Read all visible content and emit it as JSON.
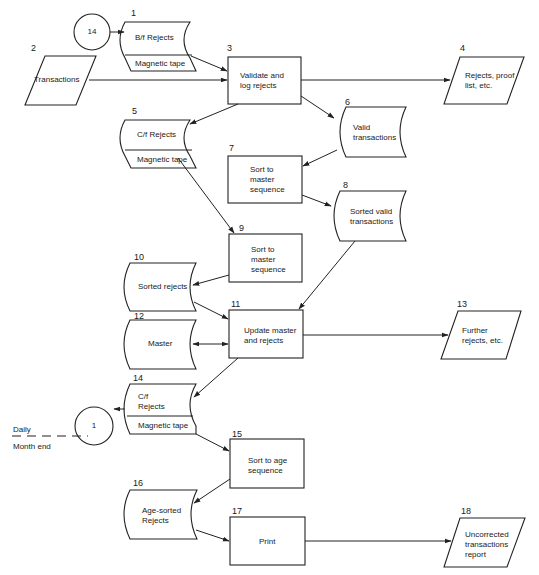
{
  "nodes": {
    "n1": {
      "number": "1",
      "label": "B/f Rejects",
      "sub": "Magnetic tape",
      "type": "magnetic-tape-file"
    },
    "n2": {
      "number": "2",
      "label": "Transactions",
      "type": "input-output"
    },
    "n3": {
      "number": "3",
      "label_l1": "Validate and",
      "label_l2": "log rejects",
      "type": "process"
    },
    "n4": {
      "number": "4",
      "label_l1": "Rejects, proof",
      "label_l2": "list, etc.",
      "type": "input-output"
    },
    "n5": {
      "number": "5",
      "label": "C/f Rejects",
      "sub": "Magnetic tape",
      "type": "magnetic-tape-file"
    },
    "n6": {
      "number": "6",
      "label_l1": "Valid",
      "label_l2": "transactions",
      "type": "storage"
    },
    "n7": {
      "number": "7",
      "label_l1": "Sort to",
      "label_l2": "master",
      "label_l3": "sequence",
      "type": "process"
    },
    "n8": {
      "number": "8",
      "label_l1": "Sorted valid",
      "label_l2": "transactions",
      "type": "storage"
    },
    "n9": {
      "number": "9",
      "label_l1": "Sort to",
      "label_l2": "master",
      "label_l3": "sequence",
      "type": "process"
    },
    "n10": {
      "number": "10",
      "label": "Sorted rejects",
      "type": "storage"
    },
    "n11": {
      "number": "11",
      "label_l1": "Update master",
      "label_l2": "and rejects",
      "type": "process"
    },
    "n12": {
      "number": "12",
      "label": "Master",
      "type": "storage"
    },
    "n13": {
      "number": "13",
      "label_l1": "Further",
      "label_l2": "rejects, etc.",
      "type": "input-output"
    },
    "n14": {
      "number": "14",
      "label_l1": "C/f",
      "label_l2": "Rejects",
      "sub": "Magnetic tape",
      "type": "magnetic-tape-file"
    },
    "n15": {
      "number": "15",
      "label_l1": "Sort to age",
      "label_l2": "sequence",
      "type": "process"
    },
    "n16": {
      "number": "16",
      "label_l1": "Age-sorted",
      "label_l2": "Rejects",
      "type": "storage"
    },
    "n17": {
      "number": "17",
      "label": "Print",
      "type": "process"
    },
    "n18": {
      "number": "18",
      "label_l1": "Uncorrected",
      "label_l2": "transactions",
      "label_l3": "report",
      "type": "input-output"
    }
  },
  "connectors": {
    "c_in": {
      "label": "14"
    },
    "c_out": {
      "label": "1"
    }
  },
  "legend": {
    "above": "Daily",
    "below": "Month end"
  },
  "edges": [
    [
      "connector-14",
      "1"
    ],
    [
      "1",
      "3"
    ],
    [
      "2",
      "3"
    ],
    [
      "3",
      "4"
    ],
    [
      "3",
      "5"
    ],
    [
      "3",
      "6"
    ],
    [
      "6",
      "7"
    ],
    [
      "7",
      "8"
    ],
    [
      "5",
      "9"
    ],
    [
      "9",
      "10"
    ],
    [
      "8",
      "11"
    ],
    [
      "10",
      "11"
    ],
    [
      "12",
      "11"
    ],
    [
      "11",
      "12"
    ],
    [
      "11",
      "13"
    ],
    [
      "11",
      "14"
    ],
    [
      "14",
      "connector-1"
    ],
    [
      "14",
      "15"
    ],
    [
      "15",
      "16"
    ],
    [
      "16",
      "17"
    ],
    [
      "17",
      "18"
    ]
  ]
}
